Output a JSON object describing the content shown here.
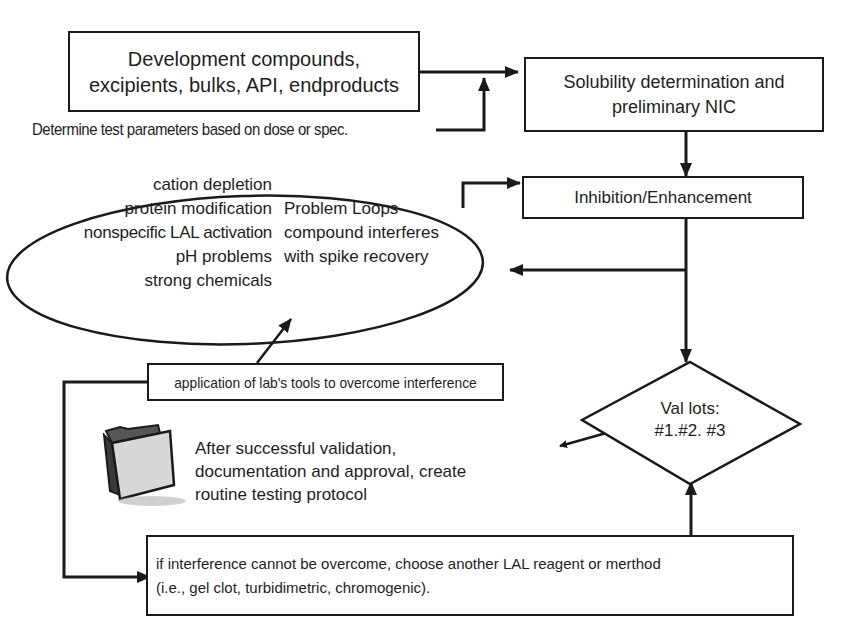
{
  "diagram": {
    "type": "flowchart",
    "nodes": {
      "dev_compounds": {
        "line1": "Development compounds,",
        "line2": "excipients, bulks, API, endproducts"
      },
      "test_params": {
        "text": "Determine test parameters based on dose or spec."
      },
      "solubility": {
        "line1": "Solubility determination and",
        "line2": "preliminary NIC"
      },
      "inhibition": {
        "text": "Inhibition/Enhancement"
      },
      "problem_loops": {
        "causes": [
          "cation depletion",
          "protein modification",
          "nonspecific LAL activation",
          "pH problems",
          "strong chemicals"
        ],
        "title_lines": [
          "Problem Loops-",
          "compound interferes",
          "with spike recovery"
        ]
      },
      "lab_tools": {
        "text": "application of lab's tools to overcome interference"
      },
      "val_lots": {
        "line1": "Val lots:",
        "line2": "#1.#2. #3"
      },
      "routine_protocol": {
        "lines": [
          "After successful validation,",
          "documentation and approval, create",
          "routine testing protocol"
        ],
        "icon": "folder-icon"
      },
      "alternate_method": {
        "line1": "if interference cannot be overcome, choose another LAL reagent or merthod",
        "line2": "(i.e., gel clot, turbidimetric, chromogenic)."
      }
    },
    "colors": {
      "line": "#1a1a1a",
      "text": "#1e1e1e",
      "background": "#ffffff",
      "folder_front": "#d8d8d8",
      "folder_back": "#555555"
    }
  }
}
